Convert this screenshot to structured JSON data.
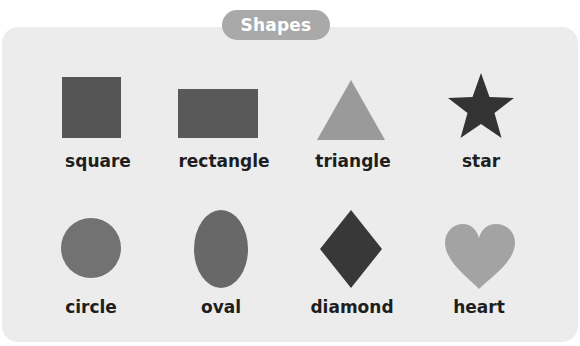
{
  "header": {
    "title": "Shapes"
  },
  "colors": {
    "page_background": "#ffffff",
    "card_background": "#ececec",
    "title_pill": "#a9a9a9",
    "title_text": "#ffffff",
    "label_text": "#1e1e1e"
  },
  "shapes": [
    {
      "name": "square",
      "label": "square",
      "icon": "square-icon",
      "color": "#555555"
    },
    {
      "name": "rectangle",
      "label": "rectangle",
      "icon": "rectangle-icon",
      "color": "#595959"
    },
    {
      "name": "triangle",
      "label": "triangle",
      "icon": "triangle-icon",
      "color": "#9a9a9a"
    },
    {
      "name": "star",
      "label": "star",
      "icon": "star-icon",
      "color": "#333333"
    },
    {
      "name": "circle",
      "label": "circle",
      "icon": "circle-icon",
      "color": "#727272"
    },
    {
      "name": "oval",
      "label": "oval",
      "icon": "oval-icon",
      "color": "#686868"
    },
    {
      "name": "diamond",
      "label": "diamond",
      "icon": "diamond-icon",
      "color": "#383838"
    },
    {
      "name": "heart",
      "label": "heart",
      "icon": "heart-icon",
      "color": "#a3a3a3"
    }
  ]
}
